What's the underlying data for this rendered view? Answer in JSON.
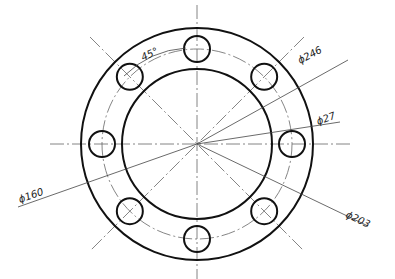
{
  "drawing": {
    "title": "Flange plate drawing",
    "center": {
      "x": 197,
      "y": 144
    },
    "outer_radius": 116,
    "inner_radius": 75,
    "bolt_circle_radius": 95,
    "hole_radius": 13,
    "hole_count": 8,
    "hole_angle_step_deg": 45
  },
  "labels": {
    "angle": "45°",
    "outer_dia": "ϕ246",
    "hole_dia": "ϕ27",
    "inner_dia": "ϕ160",
    "bolt_dia": "ϕ203"
  }
}
